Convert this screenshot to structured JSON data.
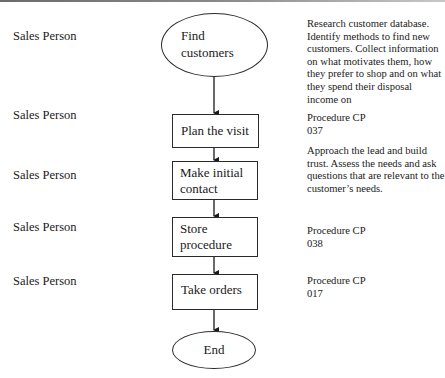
{
  "diagram": {
    "type": "flowchart",
    "roles": [
      {
        "label": "Sales Person",
        "top": 29
      },
      {
        "label": "Sales Person",
        "top": 108
      },
      {
        "label": "Sales Person",
        "top": 168
      },
      {
        "label": "Sales Person",
        "top": 220
      },
      {
        "label": "Sales Person",
        "top": 274
      }
    ],
    "steps": [
      {
        "id": "find-customers",
        "shape": "ellipse",
        "label_line1": "Find",
        "label_line2": "customers"
      },
      {
        "id": "plan-visit",
        "shape": "rectangle",
        "label_line1": "Plan the visit",
        "label_line2": ""
      },
      {
        "id": "make-contact",
        "shape": "rectangle",
        "label_line1": "Make initial",
        "label_line2": "contact"
      },
      {
        "id": "store-procedure",
        "shape": "rectangle",
        "label_line1": "Store",
        "label_line2": "procedure"
      },
      {
        "id": "take-orders",
        "shape": "rectangle",
        "label_line1": "Take orders",
        "label_line2": ""
      },
      {
        "id": "end",
        "shape": "ellipse",
        "label_line1": "End",
        "label_line2": ""
      }
    ],
    "notes": [
      {
        "text": "Research customer database. Identify methods to find new customers. Collect information on what motivates them, how they prefer to shop and on what they spend their disposal income on"
      },
      {
        "text": "Procedure CP 037"
      },
      {
        "text": "Approach the lead and build trust. Assess the needs and ask questions that are relevant to the customer’s needs."
      },
      {
        "text": "Procedure CP 038"
      },
      {
        "text": "Procedure CP 017"
      }
    ],
    "colors": {
      "stroke": "#2a2a2a",
      "text": "#1a1a1a",
      "background": "#ffffff"
    }
  }
}
